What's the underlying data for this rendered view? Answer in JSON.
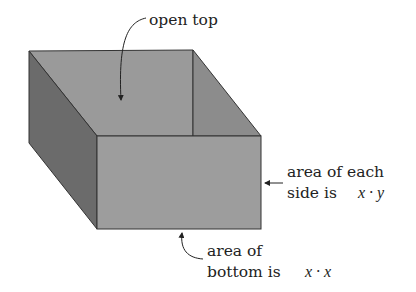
{
  "diagram": {
    "labels": {
      "open_top": "open top",
      "side_line1": "area of each",
      "side_line2": "side is",
      "side_math": "x · y",
      "bottom_line1": "area of",
      "bottom_line2": "bottom is",
      "bottom_math": "x · x"
    },
    "colors": {
      "inner_back": "#9a9a9a",
      "inner_right": "#8e8e8e",
      "left_face": "#6b6b6b",
      "front_face": "#9d9d9d",
      "edge": "#333333"
    }
  }
}
